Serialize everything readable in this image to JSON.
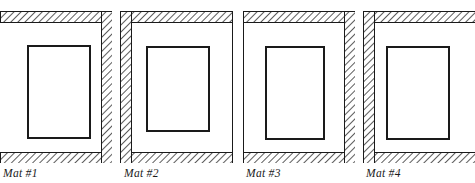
{
  "figure": {
    "background_color": "#ffffff",
    "line_color": "#1a1a1a",
    "hatch_color": "#333333",
    "fill_color": "#ffffff",
    "hatch_style": "diagonal-forward-slash"
  },
  "panels": [
    {
      "id": "mat-1",
      "label": "Mat #1",
      "label_x": 3,
      "label_y": 167,
      "outer": {
        "x": 0,
        "y": 11,
        "w": 112,
        "h": 152
      },
      "opening": {
        "x": 28,
        "y": 46,
        "w": 62,
        "h": 92
      },
      "band_thickness": 11,
      "hatched_edges": [
        "top",
        "right",
        "bottom"
      ],
      "plain_edges": [
        "left"
      ],
      "clipped_edges": [
        "left"
      ]
    },
    {
      "id": "mat-2",
      "label": "Mat #2",
      "label_x": 124,
      "label_y": 167,
      "outer": {
        "x": 120,
        "y": 11,
        "w": 113,
        "h": 152
      },
      "opening": {
        "x": 147,
        "y": 47,
        "w": 62,
        "h": 84
      },
      "band_thickness": 11,
      "hatched_edges": [
        "top",
        "left",
        "bottom"
      ],
      "plain_edges": [
        "right"
      ],
      "clipped_edges": []
    },
    {
      "id": "mat-3",
      "label": "Mat #3",
      "label_x": 246,
      "label_y": 167,
      "outer": {
        "x": 243,
        "y": 11,
        "w": 112,
        "h": 152
      },
      "opening": {
        "x": 266,
        "y": 47,
        "w": 58,
        "h": 92
      },
      "band_thickness": 11,
      "hatched_edges": [
        "top",
        "right",
        "bottom"
      ],
      "plain_edges": [
        "left"
      ],
      "clipped_edges": []
    },
    {
      "id": "mat-4",
      "label": "Mat #4",
      "label_x": 366,
      "label_y": 167,
      "outer": {
        "x": 363,
        "y": 11,
        "w": 112,
        "h": 152
      },
      "opening": {
        "x": 387,
        "y": 47,
        "w": 62,
        "h": 92
      },
      "band_thickness": 11,
      "hatched_edges": [
        "top",
        "left",
        "bottom"
      ],
      "plain_edges": [
        "right"
      ],
      "clipped_edges": [
        "right"
      ]
    }
  ]
}
